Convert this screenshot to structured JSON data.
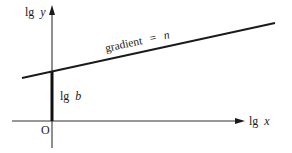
{
  "diagram": {
    "y_axis": {
      "label_prefix": "lg",
      "label_var": "y"
    },
    "x_axis": {
      "label_prefix": "lg",
      "label_var": "x"
    },
    "origin_label": "O",
    "intercept": {
      "label_prefix": "lg",
      "label_var": "b"
    },
    "line": {
      "label_text": "gradient",
      "label_eq": "=",
      "label_var": "n"
    },
    "colors": {
      "background": "#ffffff",
      "stroke": "#1a1a1a",
      "axis": "#333333"
    }
  }
}
